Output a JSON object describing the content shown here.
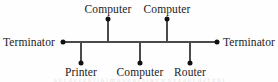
{
  "diagram": {
    "kind": "bus-network-topology",
    "background_color": "#fefefe",
    "line_color": "#4b4b4b",
    "node_color": "#111111",
    "text_color": "#232323",
    "bus": {
      "y": 42,
      "x_start": 62,
      "x_end": 218,
      "thickness": 2
    },
    "terminators": [
      {
        "id": "terminator-left",
        "label": "Terminator",
        "dot_x": 63,
        "dot_y": 42,
        "label_x": 3,
        "label_y": 36,
        "side": "left"
      },
      {
        "id": "terminator-right",
        "label": "Terminator",
        "dot_x": 217,
        "dot_y": 42,
        "label_x": 223,
        "label_y": 36,
        "side": "right"
      }
    ],
    "nodes_top": [
      {
        "id": "node-computer-top-left",
        "label": "Computer",
        "stub_x": 108,
        "stub_top": 20,
        "stub_bottom": 42,
        "dot_x": 108,
        "dot_y": 19,
        "label_x": 108,
        "label_y": 3
      },
      {
        "id": "node-computer-top-right",
        "label": "Computer",
        "stub_x": 167,
        "stub_top": 20,
        "stub_bottom": 42,
        "dot_x": 167,
        "dot_y": 19,
        "label_x": 167,
        "label_y": 3
      }
    ],
    "nodes_bottom": [
      {
        "id": "node-printer",
        "label": "Printer",
        "stub_x": 81,
        "stub_top": 42,
        "stub_bottom": 62,
        "dot_x": 81,
        "dot_y": 63,
        "label_x": 81,
        "label_y": 66
      },
      {
        "id": "node-computer-bottom",
        "label": "Computer",
        "stub_x": 140,
        "stub_top": 42,
        "stub_bottom": 62,
        "dot_x": 140,
        "dot_y": 63,
        "label_x": 140,
        "label_y": 66
      },
      {
        "id": "node-router",
        "label": "Router",
        "stub_x": 190,
        "stub_top": 42,
        "stub_bottom": 62,
        "dot_x": 190,
        "dot_y": 63,
        "label_x": 190,
        "label_y": 66
      }
    ],
    "caption_sliver": {
      "text": "a b c d e f g h i j k l m n o p q r s t u v w x y z a b c d e f g h i",
      "y": 77
    }
  }
}
